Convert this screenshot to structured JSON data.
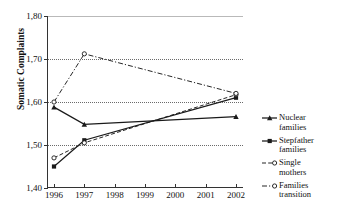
{
  "chart_data": {
    "type": "line",
    "title": "",
    "xlabel": "",
    "ylabel": "Somatic Complaints",
    "x": [
      1996,
      1997,
      1998,
      1999,
      2000,
      2001,
      2002
    ],
    "xtick_labels": [
      "1996",
      "1997",
      "1998",
      "1999",
      "2000",
      "2001",
      "2002"
    ],
    "ytick_labels": [
      "1,40",
      "1,50",
      "1,60",
      "1,70",
      "1,80"
    ],
    "ytick_values": [
      1.4,
      1.5,
      1.6,
      1.7,
      1.8
    ],
    "ylim": [
      1.4,
      1.8
    ],
    "grid": "horizontal-dotted",
    "gridlines_at": [
      1.5,
      1.6,
      1.7
    ],
    "legend_position": "right",
    "decimal_separator": ",",
    "series": [
      {
        "name": "Nuclear families",
        "label_line1": "Nuclear",
        "label_line2": "families",
        "marker": "filled-triangle",
        "linestyle": "solid",
        "color": "#1a1a1a",
        "x": [
          1996,
          1997,
          2002
        ],
        "values": [
          1.588,
          1.548,
          1.566
        ]
      },
      {
        "name": "Stepfather families",
        "label_line1": "Stepfather",
        "label_line2": "families",
        "marker": "filled-square",
        "linestyle": "solid",
        "color": "#1a1a1a",
        "x": [
          1996,
          1997,
          2002
        ],
        "values": [
          1.45,
          1.511,
          1.61
        ]
      },
      {
        "name": "Single mothers",
        "label_line1": "Single",
        "label_line2": "mothers",
        "marker": "open-circle",
        "linestyle": "dashed",
        "color": "#1a1a1a",
        "x": [
          1996,
          1997,
          2002
        ],
        "values": [
          1.47,
          1.505,
          1.617
        ]
      },
      {
        "name": "Families transition",
        "label_line1": "Families",
        "label_line2": "transition",
        "marker": "open-circle",
        "linestyle": "dash-dot",
        "color": "#1a1a1a",
        "x": [
          1996,
          1997,
          2002
        ],
        "values": [
          1.6,
          1.712,
          1.62
        ]
      }
    ]
  },
  "axis": {
    "y_title": "Somatic Complaints"
  },
  "artifact": {
    "top_crop_text": "·   ·    ·"
  }
}
